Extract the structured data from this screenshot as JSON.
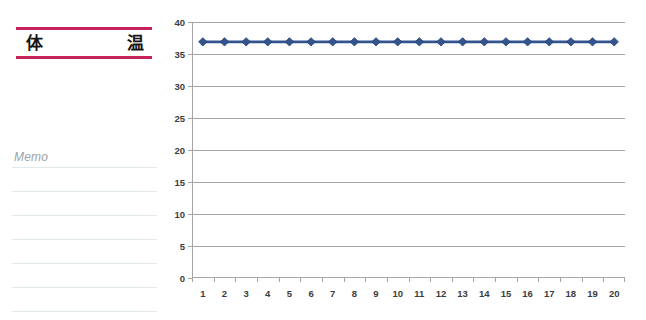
{
  "left_panel": {
    "title": "体    温",
    "memo_label": "Memo",
    "accent_color": "#c8225a",
    "memo_line_count": 7
  },
  "chart_data": {
    "type": "line",
    "title": "",
    "xlabel": "",
    "ylabel": "",
    "categories": [
      "1",
      "2",
      "3",
      "4",
      "5",
      "6",
      "7",
      "8",
      "9",
      "10",
      "11",
      "12",
      "13",
      "14",
      "15",
      "16",
      "17",
      "18",
      "19",
      "20"
    ],
    "values": [
      36.9,
      36.9,
      36.9,
      36.9,
      36.9,
      36.9,
      36.9,
      36.9,
      36.9,
      36.9,
      36.9,
      36.9,
      36.9,
      36.9,
      36.9,
      36.9,
      36.9,
      36.9,
      36.9,
      36.9
    ],
    "series": [
      {
        "name": "体温",
        "color": "#33548f",
        "marker": "diamond",
        "values": [
          36.9,
          36.9,
          36.9,
          36.9,
          36.9,
          36.9,
          36.9,
          36.9,
          36.9,
          36.9,
          36.9,
          36.9,
          36.9,
          36.9,
          36.9,
          36.9,
          36.9,
          36.9,
          36.9,
          36.9
        ]
      }
    ],
    "ylim": [
      0,
      40
    ],
    "ytick_labels": [
      "40",
      "35",
      "30",
      "25",
      "20",
      "15",
      "10",
      "5",
      "0"
    ],
    "ytick_values": [
      40,
      35,
      30,
      25,
      20,
      15,
      10,
      5,
      0
    ],
    "grid": true,
    "gridline_color": "#a6a6a6",
    "legend": false,
    "legend_position": "none"
  }
}
